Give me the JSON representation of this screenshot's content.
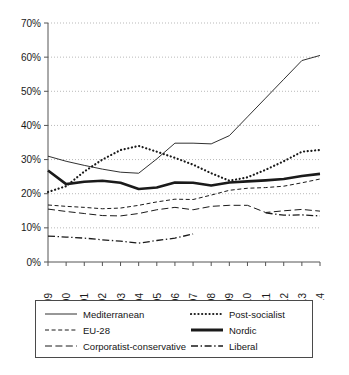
{
  "chart_data": {
    "type": "line",
    "title": "",
    "xlabel": "",
    "ylabel": "",
    "x": [
      1999,
      2000,
      2001,
      2002,
      2003,
      2004,
      2005,
      2006,
      2007,
      2008,
      2009,
      2010,
      2011,
      2012,
      2013,
      2014
    ],
    "xtick_labels": [
      "1999",
      "2000",
      "2001",
      "2002",
      "2003",
      "2004",
      "2005",
      "2006",
      "2007",
      "2008",
      "2009",
      "2010",
      "2011",
      "2012",
      "2013",
      "2014"
    ],
    "ytick_labels": [
      "0%",
      "10%",
      "20%",
      "30%",
      "40%",
      "50%",
      "60%",
      "70%"
    ],
    "ytick_values": [
      0,
      10,
      20,
      30,
      40,
      50,
      60,
      70
    ],
    "ylim": [
      0,
      70
    ],
    "grid": "horizontal-dotted",
    "legend_position": "below",
    "series": [
      {
        "name": "Mediterranean",
        "style": "solid-thin",
        "values": [
          31.0,
          29.5,
          28.3,
          27.2,
          26.3,
          26.0,
          30.2,
          34.8,
          34.8,
          34.6,
          37.0,
          42.5,
          48.0,
          53.5,
          59.0,
          60.5
        ]
      },
      {
        "name": "Post-socialist",
        "style": "dotted",
        "values": [
          20.5,
          22.2,
          26.5,
          30.0,
          32.8,
          34.0,
          32.3,
          30.5,
          28.5,
          26.0,
          23.8,
          24.8,
          27.0,
          29.5,
          32.3,
          32.8
        ]
      },
      {
        "name": "EU-28",
        "style": "dashed-short",
        "values": [
          16.7,
          16.3,
          16.0,
          15.6,
          15.8,
          16.6,
          17.6,
          18.4,
          18.3,
          19.6,
          21.0,
          21.6,
          21.8,
          22.2,
          23.2,
          24.3
        ]
      },
      {
        "name": "Nordic",
        "style": "solid-thick",
        "values": [
          26.8,
          22.8,
          23.5,
          23.8,
          23.2,
          21.4,
          21.8,
          23.3,
          23.2,
          22.4,
          23.3,
          23.6,
          23.9,
          24.3,
          25.2,
          25.8
        ]
      },
      {
        "name": "Corporatist-conservative",
        "style": "dashed-long",
        "values": [
          15.5,
          14.8,
          14.2,
          13.6,
          13.5,
          14.2,
          15.3,
          16.0,
          15.3,
          16.3,
          16.6,
          16.6,
          14.5,
          15.0,
          15.4,
          14.9
        ]
      },
      {
        "name": "Liberal",
        "style": "dash-dot",
        "values": [
          7.6,
          7.3,
          7.0,
          6.5,
          6.1,
          5.5,
          6.3,
          7.0,
          8.2,
          null,
          null,
          null,
          14.4,
          13.7,
          13.8,
          13.5
        ]
      }
    ]
  },
  "legend": {
    "items": [
      {
        "label": "Mediterranean",
        "swatch": "solid-thin-line-swatch"
      },
      {
        "label": "Post-socialist",
        "swatch": "dotted-line-swatch"
      },
      {
        "label": "EU-28",
        "swatch": "dashed-short-line-swatch"
      },
      {
        "label": "Nordic",
        "swatch": "solid-thick-line-swatch"
      },
      {
        "label": "Corporatist-conservative",
        "swatch": "dashed-long-line-swatch"
      },
      {
        "label": "Liberal",
        "swatch": "dash-dot-line-swatch"
      }
    ]
  }
}
